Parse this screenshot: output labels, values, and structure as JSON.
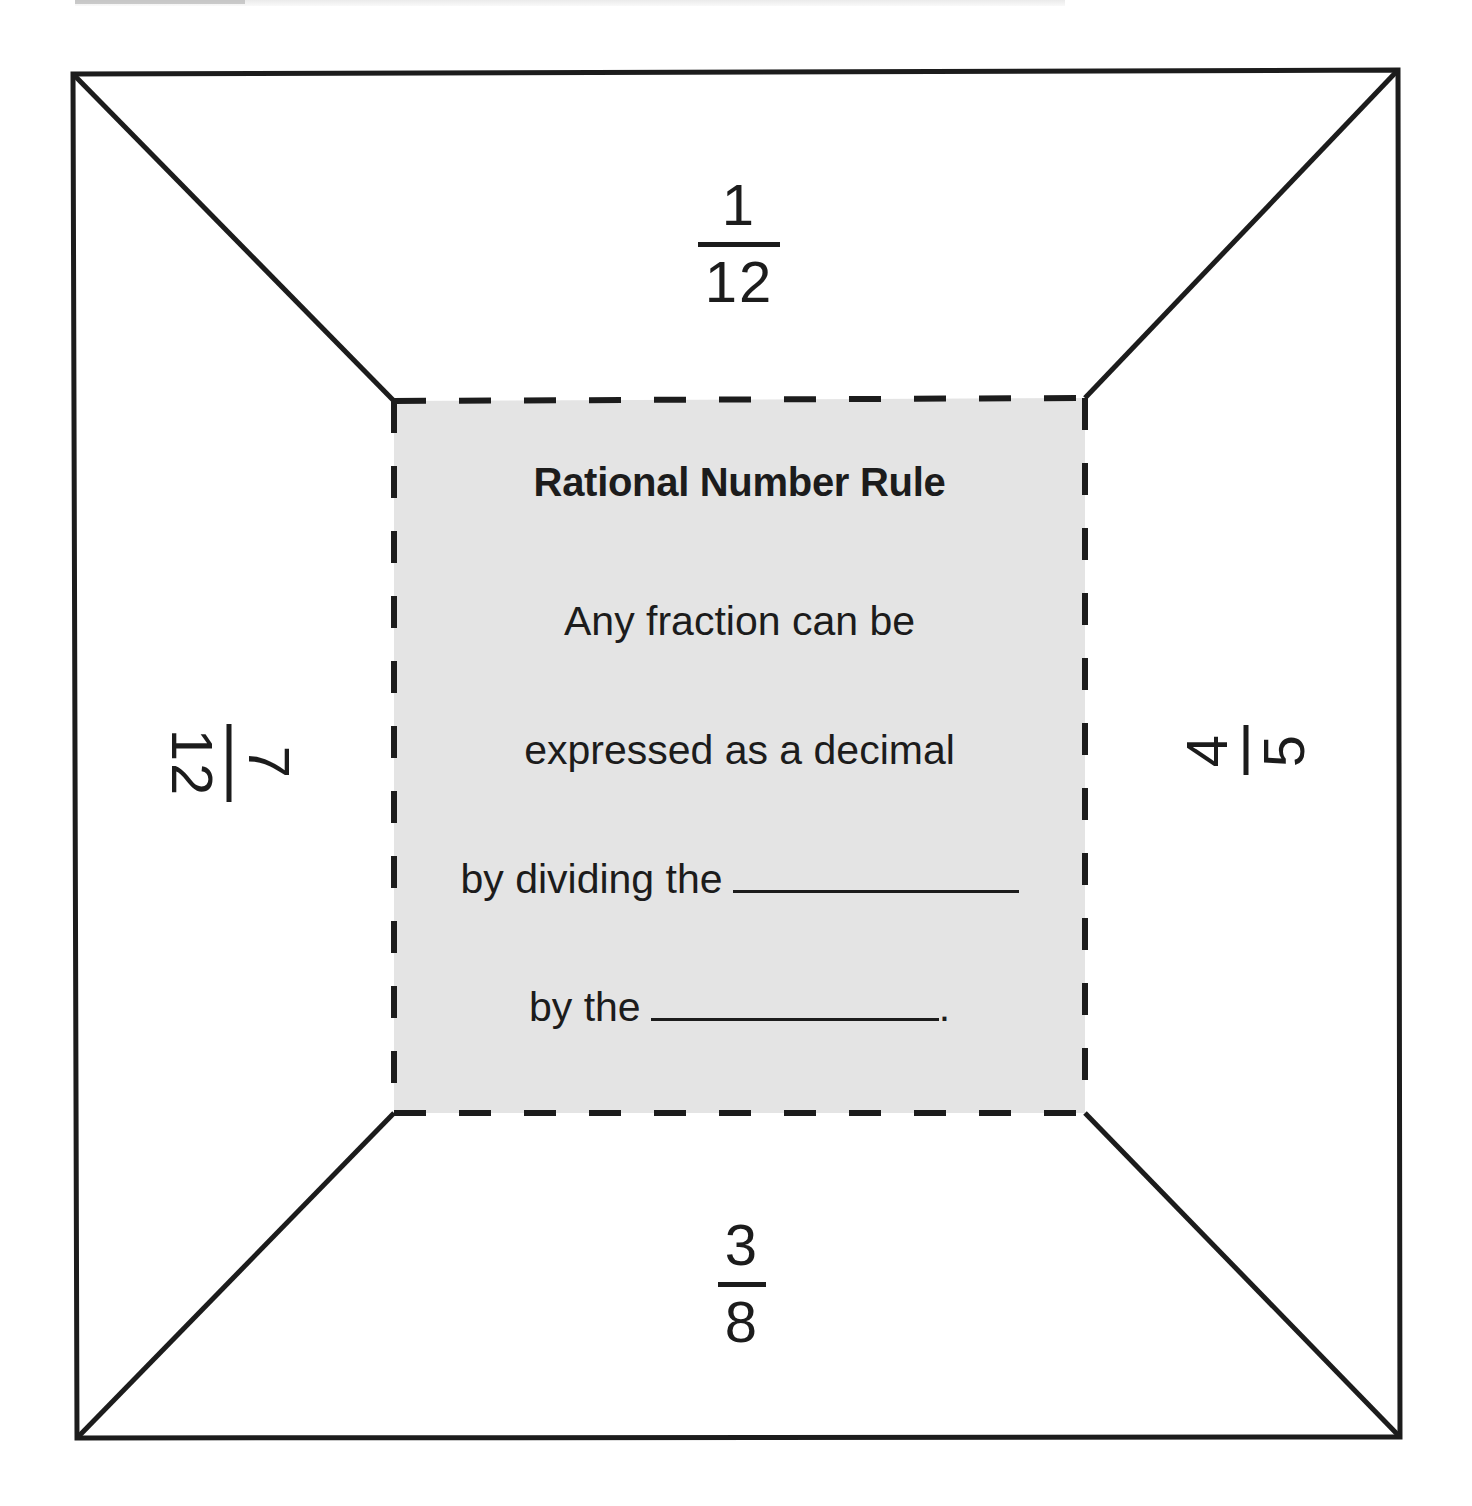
{
  "worksheet": {
    "colors": {
      "line": "#1c1c1c",
      "panel_fill": "#e4e4e4",
      "background": "#ffffff"
    },
    "center_panel": {
      "title": "Rational Number Rule",
      "lines": [
        "Any fraction can be",
        "expressed as a decimal",
        "by dividing the",
        "by the"
      ],
      "final_punctuation": "."
    },
    "flaps": {
      "top": {
        "numerator": "1",
        "denominator": "12",
        "rotation": "0deg"
      },
      "right": {
        "numerator": "4",
        "denominator": "5",
        "rotation": "-90deg"
      },
      "bottom": {
        "numerator": "3",
        "denominator": "8",
        "rotation": "0deg"
      },
      "left": {
        "numerator": "7",
        "denominator": "12",
        "rotation": "90deg"
      }
    }
  }
}
